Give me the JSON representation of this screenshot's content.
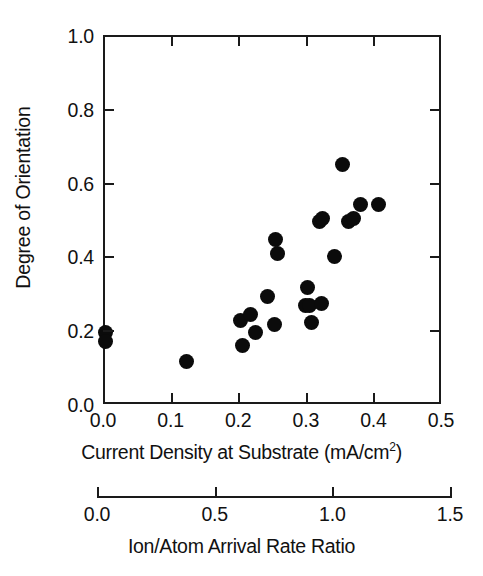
{
  "chart_data": {
    "type": "scatter",
    "title": "",
    "xlabel": "Current Density at Substrate (mA/cm2)",
    "xlabel_main": "Current Density at Substrate (mA/cm",
    "xlabel_sup": "2",
    "xlabel_tail": ")",
    "ylabel": "Degree of Orientation",
    "xlim": [
      0.0,
      0.5
    ],
    "ylim": [
      0.0,
      1.0
    ],
    "xticks": [
      "0.0",
      "0.1",
      "0.2",
      "0.3",
      "0.4",
      "0.5"
    ],
    "xtick_values": [
      0.0,
      0.1,
      0.2,
      0.3,
      0.4,
      0.5
    ],
    "yticks": [
      "0.0",
      "0.2",
      "0.4",
      "0.6",
      "0.8",
      "1.0"
    ],
    "ytick_values": [
      0.0,
      0.2,
      0.4,
      0.6,
      0.8,
      1.0
    ],
    "grid": false,
    "legend": null,
    "marker": "filled-circle",
    "marker_color": "#0b0b0b",
    "frame_color": "#1a1a1a",
    "secondary_axis": {
      "label": "Ion/Atom Arrival Rate Ratio",
      "lim": [
        0.0,
        1.5
      ],
      "ticks": [
        "0.0",
        "0.5",
        "1.0",
        "1.5"
      ],
      "tick_values": [
        0.0,
        0.5,
        1.0,
        1.5
      ]
    },
    "x": [
      0.0,
      0.0,
      0.12,
      0.2,
      0.203,
      0.215,
      0.222,
      0.24,
      0.25,
      0.252,
      0.255,
      0.297,
      0.3,
      0.302,
      0.305,
      0.318,
      0.32,
      0.322,
      0.325,
      0.34,
      0.352,
      0.36,
      0.365,
      0.368,
      0.378,
      0.405
    ],
    "y": [
      0.2,
      0.175,
      0.12,
      0.232,
      0.163,
      0.248,
      0.2,
      0.296,
      0.222,
      0.45,
      0.412,
      0.272,
      0.322,
      0.272,
      0.225,
      0.5,
      0.278,
      0.508,
      0.497,
      0.405,
      0.655,
      0.5,
      0.497,
      0.508,
      0.545,
      0.545
    ],
    "points": [
      {
        "x": 0.0,
        "y": 0.2
      },
      {
        "x": 0.0,
        "y": 0.175
      },
      {
        "x": 0.12,
        "y": 0.12
      },
      {
        "x": 0.2,
        "y": 0.232
      },
      {
        "x": 0.203,
        "y": 0.163
      },
      {
        "x": 0.215,
        "y": 0.248
      },
      {
        "x": 0.222,
        "y": 0.2
      },
      {
        "x": 0.24,
        "y": 0.296
      },
      {
        "x": 0.25,
        "y": 0.222
      },
      {
        "x": 0.252,
        "y": 0.45
      },
      {
        "x": 0.255,
        "y": 0.412
      },
      {
        "x": 0.297,
        "y": 0.272
      },
      {
        "x": 0.3,
        "y": 0.322
      },
      {
        "x": 0.302,
        "y": 0.272
      },
      {
        "x": 0.305,
        "y": 0.225
      },
      {
        "x": 0.318,
        "y": 0.5
      },
      {
        "x": 0.32,
        "y": 0.278
      },
      {
        "x": 0.322,
        "y": 0.508
      },
      {
        "x": 0.34,
        "y": 0.405
      },
      {
        "x": 0.352,
        "y": 0.655
      },
      {
        "x": 0.36,
        "y": 0.5
      },
      {
        "x": 0.368,
        "y": 0.508
      },
      {
        "x": 0.378,
        "y": 0.545
      },
      {
        "x": 0.405,
        "y": 0.545
      }
    ]
  }
}
